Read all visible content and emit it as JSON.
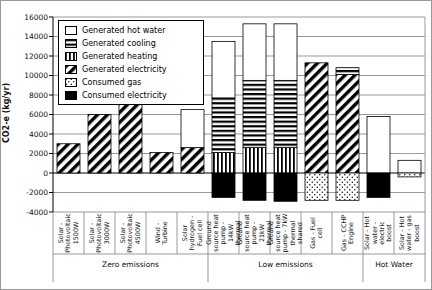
{
  "chart_data": {
    "type": "bar",
    "subtype": "stacked",
    "title": "",
    "ylabel": "CO2-e (kg/yr)",
    "ylim": [
      -4000,
      16000
    ],
    "yticks": [
      16000,
      14000,
      12000,
      10000,
      8000,
      6000,
      4000,
      2000,
      0,
      -2000,
      -4000
    ],
    "grid": true,
    "legend_position": "top-left-inside",
    "legend": [
      {
        "key": "hot_water",
        "label": "Generated hot water",
        "pattern": "white"
      },
      {
        "key": "cooling",
        "label": "Generated cooling",
        "pattern": "horizontal-stripes"
      },
      {
        "key": "heating",
        "label": "Generated heating",
        "pattern": "vertical-stripes"
      },
      {
        "key": "electricity",
        "label": "Generated electricity",
        "pattern": "diagonal-stripes"
      },
      {
        "key": "gas",
        "label": "Consumed gas",
        "pattern": "dots"
      },
      {
        "key": "consumed_electricity",
        "label": "Consumed electricity",
        "pattern": "solid-black"
      }
    ],
    "groups": [
      {
        "label": "Zero emissions",
        "bars": [
          {
            "label": "Solar - Photovoltaic 1500W",
            "segments": [
              {
                "key": "electricity",
                "value": 3000
              }
            ]
          },
          {
            "label": "Solar - Photovoltaic 3000W",
            "segments": [
              {
                "key": "electricity",
                "value": 6000
              }
            ]
          },
          {
            "label": "Solar - Photovoltaic 4500W",
            "segments": [
              {
                "key": "electricity",
                "value": 8800
              }
            ]
          },
          {
            "label": "Wind - Turbine",
            "segments": [
              {
                "key": "electricity",
                "value": 2100
              }
            ]
          },
          {
            "label": "Solar hydrogen - Fuel cell",
            "segments": [
              {
                "key": "electricity",
                "value": 2600
              },
              {
                "key": "hot_water",
                "value": 3900
              }
            ]
          }
        ]
      },
      {
        "label": "Low emissions",
        "bars": [
          {
            "label": "Ground source heat pump - 14kW thermal",
            "segments": [
              {
                "key": "heating",
                "value": 2100
              },
              {
                "key": "cooling",
                "value": 5600
              },
              {
                "key": "hot_water",
                "value": 5800
              },
              {
                "key": "consumed_electricity",
                "value": -2500
              }
            ]
          },
          {
            "label": "Ground source heat pump - 21kW thermal",
            "segments": [
              {
                "key": "heating",
                "value": 2600
              },
              {
                "key": "cooling",
                "value": 6900
              },
              {
                "key": "hot_water",
                "value": 5800
              },
              {
                "key": "consumed_electricity",
                "value": -2800
              }
            ]
          },
          {
            "label": "Ground source heat pump - 7kW thermal shared",
            "segments": [
              {
                "key": "heating",
                "value": 2600
              },
              {
                "key": "cooling",
                "value": 6900
              },
              {
                "key": "hot_water",
                "value": 5800
              },
              {
                "key": "consumed_electricity",
                "value": -2900
              }
            ]
          },
          {
            "label": "Gas - Fuel cell",
            "segments": [
              {
                "key": "electricity",
                "value": 11300
              },
              {
                "key": "gas",
                "value": -2800
              }
            ]
          },
          {
            "label": "Gas - CCHP Engine",
            "segments": [
              {
                "key": "electricity",
                "value": 10100
              },
              {
                "key": "cooling",
                "value": 700
              },
              {
                "key": "gas",
                "value": -2800
              }
            ]
          }
        ]
      },
      {
        "label": "Hot Water",
        "bars": [
          {
            "label": "Solar - Hot water - electric boost",
            "segments": [
              {
                "key": "hot_water",
                "value": 5800
              },
              {
                "key": "consumed_electricity",
                "value": -2500
              }
            ]
          },
          {
            "label": "Solar - Hot water - gas boost",
            "segments": [
              {
                "key": "hot_water",
                "value": 1300
              },
              {
                "key": "gas",
                "value": -400
              }
            ]
          }
        ]
      }
    ],
    "colors": {
      "foreground": "#000000",
      "background": "#ffffff",
      "gridline": "#9a9a9a"
    }
  }
}
